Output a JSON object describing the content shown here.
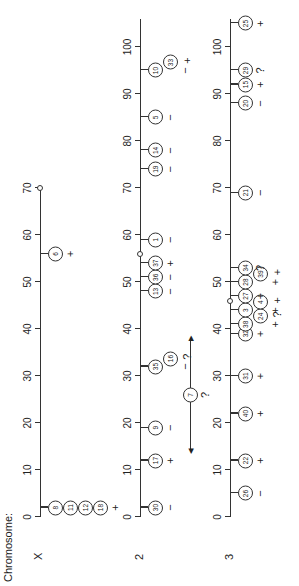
{
  "title": "Chromosome:",
  "scale": {
    "origin_u": 69,
    "px_per_unit": 4.7
  },
  "chromosomes": [
    {
      "name": "X",
      "axis_v": 40,
      "length": 70,
      "ticks": [
        0,
        10,
        20,
        30,
        40,
        50,
        60,
        70
      ],
      "centromere_end": 70,
      "markers": [
        {
          "pos": 2,
          "ids": [
            "8",
            "11",
            "12",
            "18"
          ],
          "sign": "+"
        },
        {
          "pos": 56,
          "ids": [
            "6"
          ],
          "sign": "+"
        }
      ]
    },
    {
      "name": "2",
      "axis_v": 140,
      "length": 106,
      "ticks": [
        0,
        10,
        20,
        30,
        40,
        50,
        60,
        70,
        80,
        90,
        100
      ],
      "centromere_pos": 56,
      "markers": [
        {
          "pos": 2,
          "ids": [
            "30"
          ],
          "sign": "−"
        },
        {
          "pos": 12,
          "ids": [
            "17"
          ],
          "sign": "+"
        },
        {
          "pos": 19,
          "ids": [
            "9"
          ],
          "sign": "−"
        },
        {
          "pos": 32,
          "ids": [
            "35",
            "16"
          ],
          "sign": "−",
          "sign2": "?"
        },
        {
          "pos": 48,
          "ids": [
            "13"
          ],
          "sign": "−"
        },
        {
          "pos": 51,
          "ids": [
            "36"
          ],
          "sign": "−"
        },
        {
          "pos": 54,
          "ids": [
            "37"
          ],
          "sign": "+"
        },
        {
          "pos": 59,
          "ids": [
            "1"
          ],
          "sign": "−"
        },
        {
          "pos": 74,
          "ids": [
            "19"
          ],
          "sign": "−"
        },
        {
          "pos": 78,
          "ids": [
            "14"
          ],
          "sign": "−"
        },
        {
          "pos": 85,
          "ids": [
            "5"
          ],
          "sign": "−"
        },
        {
          "pos": 95,
          "ids": [
            "10",
            "33"
          ],
          "sign": "−",
          "sign2": "+"
        }
      ],
      "floating": {
        "id": "7",
        "sign": "?",
        "range": [
          14,
          38
        ]
      }
    },
    {
      "name": "3",
      "axis_v": 230,
      "length": 106,
      "ticks": [
        0,
        10,
        20,
        30,
        40,
        50,
        60,
        70,
        80,
        90,
        100
      ],
      "centromere_pos": 46,
      "markers": [
        {
          "pos": 5,
          "ids": [
            "26"
          ],
          "sign": "−"
        },
        {
          "pos": 12,
          "ids": [
            "22"
          ],
          "sign": "+"
        },
        {
          "pos": 22,
          "ids": [
            "40"
          ],
          "sign": "+"
        },
        {
          "pos": 30,
          "ids": [
            "31"
          ],
          "sign": "+"
        },
        {
          "pos": 39,
          "ids": [
            "32"
          ],
          "sign": "+"
        },
        {
          "pos": 41,
          "ids": [
            "38",
            "24"
          ],
          "sign": "+",
          "sign2": "?"
        },
        {
          "pos": 44,
          "ids": [
            "3",
            "4"
          ],
          "sign": "+",
          "sign2": "+"
        },
        {
          "pos": 47,
          "ids": [
            "27"
          ],
          "sign": "+"
        },
        {
          "pos": 50,
          "ids": [
            "28",
            "39"
          ],
          "sign": "+",
          "sign2": "+"
        },
        {
          "pos": 53,
          "ids": [
            "34"
          ],
          "sign": "?"
        },
        {
          "pos": 69,
          "ids": [
            "21"
          ],
          "sign": "−"
        },
        {
          "pos": 88,
          "ids": [
            "20"
          ],
          "sign": "−"
        },
        {
          "pos": 92,
          "ids": [
            "15"
          ],
          "sign": "+"
        },
        {
          "pos": 95,
          "ids": [
            "29"
          ],
          "sign": "?"
        },
        {
          "pos": 105,
          "ids": [
            "25"
          ],
          "sign": "+"
        }
      ]
    }
  ]
}
